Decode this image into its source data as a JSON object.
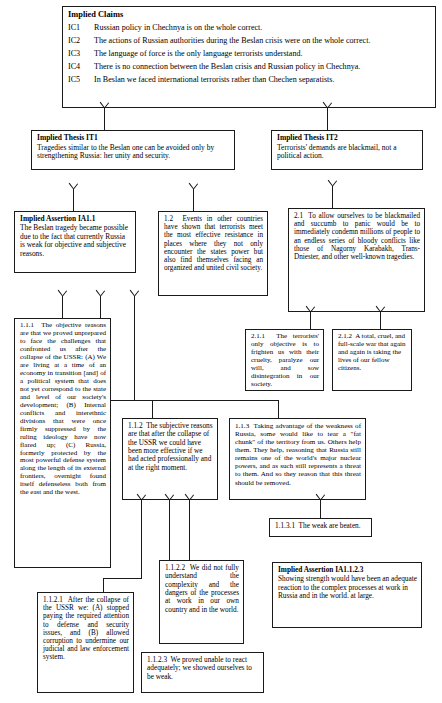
{
  "diagram": {
    "type": "argument-map"
  },
  "nodes": {
    "implied_claims": {
      "heading": "Implied Claims",
      "items": [
        {
          "key": "IC1",
          "text": "Russian policy in Chechnya is on the whole correct."
        },
        {
          "key": "IC2",
          "text": "The actions of Russian authorities during the Beslan crisis were on the whole correct."
        },
        {
          "key": "IC3",
          "text": "The language of force is the only language terrorists understand."
        },
        {
          "key": "IC4",
          "text": "There is no connection between the Beslan crisis and Russian policy in Chechnya."
        },
        {
          "key": "IC5",
          "text": "In Beslan we faced international terrorists rather than Chechen separatists."
        }
      ]
    },
    "it1": {
      "title": "Implied Thesis IT1",
      "text": "Tragedies similar to the Beslan one can be avoided only by strengthening Russia: her unity and security."
    },
    "it2": {
      "title": "Implied Thesis IT2",
      "text": "Terrorists' demands are blackmail, not a political action."
    },
    "ia11": {
      "title": "Implied Assertion IA1.1",
      "text": "The Beslan tragedy became possible due to the fact that currently Russia is weak for objective and subjective reasons."
    },
    "n12": {
      "label": "1.2",
      "text": "Events in other countries have shown that terrorists meet the most effective resistance in places where they not only encounter the states power but also find themselves facing an organized and united civil society."
    },
    "n21": {
      "label": "2.1",
      "text": "To allow ourselves to be blackmailed and succumb to panic would be to immediately condemn millions of people to an endless series of bloody conflicts like those of Nagorny Karabakh, Trans-Dniester, and other well-known tragedies."
    },
    "n211": {
      "label": "2.1.1",
      "text": "The terrorists' only objective is to frighten us with their cruelty, paralyze our will, and sow disintegration in our society."
    },
    "n212": {
      "label": "2.1.2",
      "text": "A total, cruel, and full-scale war that again and again is taking the lives of our fellow citizens."
    },
    "n111": {
      "label": "1.1.1",
      "text": "The objective reasons are that we proved unprepared to face the challenges that confronted us after the collapse of the USSR: (A) We are living at a time of an economy in transition [and] of a political system that does not yet correspond to the state and level of our society's development; (B) Internal conflicts and interethnic divisions that were once firmly suppressed by the ruling ideology have now flared up; (C) Russia, formerly protected by the most powerful defense system along the length of its external frontiers, overnight found itself defenseless both from the east and the west."
    },
    "n112": {
      "label": "1.1.2",
      "text": "The subjective reasons are that after the collapse of the USSR we could have been more effective if we had acted professionally and at the right moment."
    },
    "n113": {
      "label": "1.1.3",
      "text": "Taking advantage of the weakness of Russia, some would like to tear a \"fat chunk\" of the territory from us. Others help them. They help, reasoning that Russia still remains one of the world's major nuclear powers, and as such still represents a threat to them. And so they reason that this threat should be removed."
    },
    "n1131": {
      "label": "1.1.3.1",
      "text": "The weak are beaten."
    },
    "n1121": {
      "label": "1.1.2.1",
      "text": "After the collapse of the USSR we: (A) stopped paying the required attention to defense and security issues, and (B) allowed corruption to undermine our judicial and law enforcement system."
    },
    "n1122": {
      "label": "1.1.2.2",
      "text": "We did not fully understand the complexity and the dangers of the processes at work in our own country and in the world."
    },
    "n1123": {
      "label": "1.1.2.3",
      "text": "We proved unable to react adequately; we showed ourselves to be weak."
    },
    "ia1123": {
      "title": "Implied Assertion IA1.1.2.3",
      "text": "Showing strength would have been an adequate reaction to the complex processes at work in Russia and in the world. at large."
    }
  },
  "edges": [
    {
      "from": "it1",
      "to": "implied_claims"
    },
    {
      "from": "it2",
      "to": "implied_claims"
    },
    {
      "from": "ia11",
      "to": "it1"
    },
    {
      "from": "n12",
      "to": "it1"
    },
    {
      "from": "n21",
      "to": "it2"
    },
    {
      "from": "n211",
      "to": "n21"
    },
    {
      "from": "n212",
      "to": "n21"
    },
    {
      "from": "n111",
      "to": "ia11"
    },
    {
      "from": "n112",
      "to": "ia11"
    },
    {
      "from": "n113",
      "to": "ia11"
    },
    {
      "from": "n1131",
      "to": "n113"
    },
    {
      "from": "n1121",
      "to": "n112"
    },
    {
      "from": "n1122",
      "to": "n112"
    },
    {
      "from": "n1123",
      "to": "n112"
    },
    {
      "from": "ia1123",
      "to": "n1123"
    }
  ],
  "colors": {
    "stroke": "#1a1a1a",
    "background": "#ffffff",
    "text": "#000000"
  }
}
